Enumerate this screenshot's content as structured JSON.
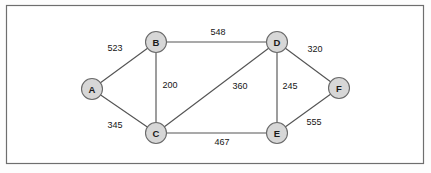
{
  "diagram": {
    "frame": {
      "x": 6,
      "y": 5,
      "width": 418,
      "height": 159,
      "border_color": "#6e6e6e",
      "background_color": "#ffffff"
    },
    "style": {
      "node_fill": "#d7d7d7",
      "node_stroke": "#6a6a6a",
      "edge_stroke": "#555555",
      "label_color": "#1a1a1a",
      "weight_color": "#151515",
      "node_radius": 10.5
    },
    "nodes": [
      {
        "id": "A",
        "label": "A",
        "x": 92,
        "y": 89
      },
      {
        "id": "B",
        "label": "B",
        "x": 156,
        "y": 42
      },
      {
        "id": "C",
        "label": "C",
        "x": 156,
        "y": 133
      },
      {
        "id": "D",
        "label": "D",
        "x": 277,
        "y": 42
      },
      {
        "id": "E",
        "label": "E",
        "x": 277,
        "y": 133
      },
      {
        "id": "F",
        "label": "F",
        "x": 339,
        "y": 88
      }
    ],
    "edges": [
      {
        "id": "A-B",
        "from": "A",
        "to": "B",
        "weight": "523",
        "label_x": 115,
        "label_y": 48
      },
      {
        "id": "A-C",
        "from": "A",
        "to": "C",
        "weight": "345",
        "label_x": 115,
        "label_y": 125
      },
      {
        "id": "B-C",
        "from": "B",
        "to": "C",
        "weight": "200",
        "label_x": 170,
        "label_y": 85
      },
      {
        "id": "B-D",
        "from": "B",
        "to": "D",
        "weight": "548",
        "label_x": 218,
        "label_y": 32
      },
      {
        "id": "C-D",
        "from": "C",
        "to": "D",
        "weight": "360",
        "label_x": 240,
        "label_y": 86
      },
      {
        "id": "C-E",
        "from": "C",
        "to": "E",
        "weight": "467",
        "label_x": 222,
        "label_y": 142
      },
      {
        "id": "D-E",
        "from": "D",
        "to": "E",
        "weight": "245",
        "label_x": 290,
        "label_y": 86
      },
      {
        "id": "D-F",
        "from": "D",
        "to": "F",
        "weight": "320",
        "label_x": 315,
        "label_y": 49
      },
      {
        "id": "E-F",
        "from": "E",
        "to": "F",
        "weight": "555",
        "label_x": 314,
        "label_y": 122
      }
    ]
  },
  "chart_data": {
    "type": "diagram",
    "graph_type": "undirected-weighted-graph",
    "vertices": [
      "A",
      "B",
      "C",
      "D",
      "E",
      "F"
    ],
    "edges": [
      {
        "source": "A",
        "target": "B",
        "weight": 523
      },
      {
        "source": "A",
        "target": "C",
        "weight": 345
      },
      {
        "source": "B",
        "target": "C",
        "weight": 200
      },
      {
        "source": "B",
        "target": "D",
        "weight": 548
      },
      {
        "source": "C",
        "target": "D",
        "weight": 360
      },
      {
        "source": "C",
        "target": "E",
        "weight": 467
      },
      {
        "source": "D",
        "target": "E",
        "weight": 245
      },
      {
        "source": "D",
        "target": "F",
        "weight": 320
      },
      {
        "source": "E",
        "target": "F",
        "weight": 555
      }
    ]
  }
}
